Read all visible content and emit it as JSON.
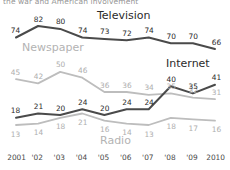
{
  "figure": {
    "cut_off_title": "the war and American involvement",
    "colors": {
      "dark": "#4a4a4a",
      "light": "#bdbdbd",
      "text_dark": "#2b2b2b",
      "text_light": "#aeaeae"
    }
  },
  "chart_data": {
    "type": "line",
    "title": "",
    "xlabel": "",
    "ylabel": "",
    "ylim": [
      0,
      90
    ],
    "grid": false,
    "legend": "inline-series-labels",
    "categories": [
      "2001",
      "'02",
      "'03",
      "'04",
      "'05",
      "'06",
      "'07",
      "'08",
      "'09",
      "2010"
    ],
    "x": [
      2001,
      2002,
      2003,
      2004,
      2005,
      2006,
      2007,
      2008,
      2009,
      2010
    ],
    "series": [
      {
        "name": "Television",
        "color": "#4a4a4a",
        "label_color": "#2b2b2b",
        "values": [
          74,
          82,
          80,
          74,
          73,
          72,
          74,
          70,
          70,
          66
        ]
      },
      {
        "name": "Newspaper",
        "color": "#bdbdbd",
        "label_color": "#aeaeae",
        "values": [
          45,
          42,
          50,
          46,
          36,
          36,
          34,
          35,
          32,
          31
        ]
      },
      {
        "name": "Internet",
        "color": "#4a4a4a",
        "label_color": "#2b2b2b",
        "values": [
          18,
          21,
          20,
          24,
          20,
          24,
          24,
          40,
          35,
          41
        ]
      },
      {
        "name": "Radio",
        "color": "#bdbdbd",
        "label_color": "#aeaeae",
        "values": [
          13,
          14,
          18,
          21,
          16,
          14,
          13,
          18,
          17,
          16
        ]
      }
    ],
    "series_label_positions": [
      {
        "name": "Television",
        "x": 97,
        "y": 9
      },
      {
        "name": "Newspaper",
        "x": 22,
        "y": 41
      },
      {
        "name": "Internet",
        "x": 166,
        "y": 57
      },
      {
        "name": "Radio",
        "x": 100,
        "y": 134
      }
    ]
  }
}
